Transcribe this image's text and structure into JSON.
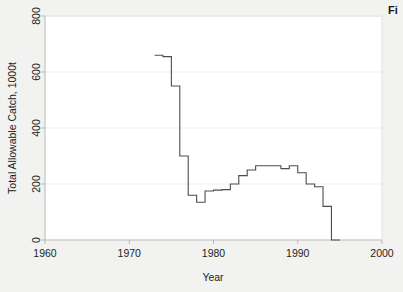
{
  "figure": {
    "corner_label": "Fi",
    "background_color": "#f2f2f0",
    "plot_background_color": "#ffffff",
    "line_color": "#4d4d4d",
    "axis_color": "#b9b9b9",
    "grid_color": "#f0f0f0",
    "text_color": "#232323"
  },
  "chart_data": {
    "type": "line",
    "line_style": "step-post",
    "title": "",
    "xlabel": "Year",
    "ylabel": "Total Allowable Catch, 1000t",
    "xlim": [
      1960,
      2000
    ],
    "ylim": [
      0,
      800
    ],
    "xticks": [
      1960,
      1970,
      1980,
      1990,
      2000
    ],
    "xtick_labels": [
      "1960",
      "1970",
      "1980",
      "1990",
      "2000"
    ],
    "yticks": [
      0,
      200,
      400,
      600,
      800
    ],
    "ytick_labels": [
      "0",
      "200",
      "400",
      "600",
      "800"
    ],
    "grid": "horizontal",
    "legend": "none",
    "series": [
      {
        "name": "Total Allowable Catch",
        "x": [
          1973,
          1974,
          1975,
          1976,
          1977,
          1978,
          1979,
          1980,
          1981,
          1982,
          1983,
          1984,
          1985,
          1986,
          1987,
          1988,
          1989,
          1990,
          1991,
          1992,
          1993,
          1994
        ],
        "values": [
          660,
          655,
          550,
          300,
          160,
          135,
          175,
          178,
          180,
          200,
          230,
          250,
          265,
          265,
          265,
          255,
          265,
          240,
          200,
          190,
          120,
          0
        ]
      }
    ]
  }
}
